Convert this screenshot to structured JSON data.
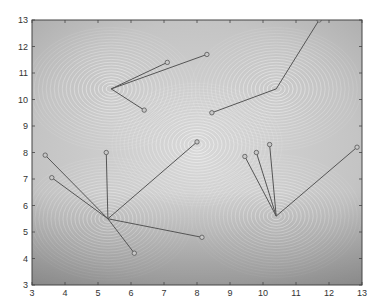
{
  "chart_data": {
    "type": "contour",
    "title": "",
    "xlabel": "",
    "ylabel": "",
    "xlim": [
      3,
      13
    ],
    "ylim": [
      3,
      13
    ],
    "xticks": [
      3,
      4,
      5,
      6,
      7,
      8,
      9,
      10,
      11,
      12,
      13
    ],
    "yticks": [
      3,
      4,
      5,
      6,
      7,
      8,
      9,
      10,
      11,
      12,
      13
    ],
    "grid": false,
    "background": "grayscale textured image with white contour lines",
    "contour_centers": [
      {
        "x": 5.4,
        "y": 10.4
      },
      {
        "x": 10.4,
        "y": 10.4
      },
      {
        "x": 8.0,
        "y": 8.3
      },
      {
        "x": 5.3,
        "y": 5.5
      },
      {
        "x": 10.4,
        "y": 5.6
      }
    ],
    "line_segments": [
      {
        "from": [
          5.4,
          10.4
        ],
        "to": [
          7.1,
          11.4
        ]
      },
      {
        "from": [
          5.4,
          10.4
        ],
        "to": [
          8.3,
          11.7
        ]
      },
      {
        "from": [
          5.4,
          10.4
        ],
        "to": [
          6.4,
          9.6
        ]
      },
      {
        "from": [
          10.4,
          10.4
        ],
        "to": [
          11.7,
          13.0
        ]
      },
      {
        "from": [
          10.4,
          10.4
        ],
        "to": [
          8.45,
          9.5
        ]
      },
      {
        "from": [
          5.3,
          5.5
        ],
        "to": [
          3.4,
          7.9
        ]
      },
      {
        "from": [
          5.3,
          5.5
        ],
        "to": [
          3.6,
          7.05
        ]
      },
      {
        "from": [
          5.3,
          5.5
        ],
        "to": [
          5.25,
          8.0
        ]
      },
      {
        "from": [
          5.3,
          5.5
        ],
        "to": [
          8.0,
          8.4
        ]
      },
      {
        "from": [
          5.3,
          5.5
        ],
        "to": [
          8.15,
          4.8
        ]
      },
      {
        "from": [
          5.3,
          5.5
        ],
        "to": [
          6.1,
          4.2
        ]
      },
      {
        "from": [
          10.4,
          5.6
        ],
        "to": [
          9.45,
          7.85
        ]
      },
      {
        "from": [
          10.4,
          5.6
        ],
        "to": [
          9.8,
          8.0
        ]
      },
      {
        "from": [
          10.4,
          5.6
        ],
        "to": [
          10.2,
          8.3
        ]
      },
      {
        "from": [
          10.4,
          5.6
        ],
        "to": [
          12.85,
          8.2
        ]
      }
    ]
  }
}
